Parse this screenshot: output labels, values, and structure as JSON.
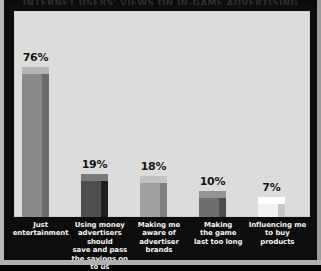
{
  "figure": {
    "title_strip": "INTERNET USERS' VIEWS ON IN-GAME ADVERTISING",
    "background_color": "#0d0d0d",
    "plot_background_color": "#dcdcdc"
  },
  "chart_data": {
    "type": "bar",
    "title": "INTERNET USERS' VIEWS ON IN-GAME ADVERTISING",
    "xlabel": "",
    "ylabel": "",
    "ylim": [
      0,
      100
    ],
    "grid": false,
    "legend": "none",
    "categories": [
      "Just entertainment",
      "Using money advertisers should save and pass the savings on to us",
      "Making me aware of advertiser brands",
      "Making the game last too long",
      "Influencing me to buy products"
    ],
    "values": [
      76,
      19,
      18,
      10,
      7
    ],
    "value_labels": [
      "76%",
      "19%",
      "18%",
      "10%",
      "7%"
    ],
    "bar_colors": [
      "#8a8a8a",
      "#4f4f4f",
      "#a0a0a0",
      "#6e6e6e",
      "#f2f2f2"
    ],
    "bar_side_colors": [
      "#6b6b6b",
      "#1f1f1f",
      "#7f7f7f",
      "#4c4c4c",
      "#c8c8c8"
    ],
    "bar_top_colors": [
      "#b4b4b4",
      "#7a7a7a",
      "#c2c2c2",
      "#949494",
      "#ffffff"
    ]
  },
  "bars": [
    {
      "label_lines": [
        "Just",
        "entertainment"
      ],
      "value_label": "76%",
      "value": 76,
      "front_color": "#8a8a8a",
      "side_color": "#6b6b6b",
      "top_color": "#b4b4b4"
    },
    {
      "label_lines": [
        "Using money",
        "advertisers should",
        "save and pass",
        "the savings on to us"
      ],
      "value_label": "19%",
      "value": 19,
      "front_color": "#4f4f4f",
      "side_color": "#1f1f1f",
      "top_color": "#7a7a7a"
    },
    {
      "label_lines": [
        "Making me",
        "aware of",
        "advertiser",
        "brands"
      ],
      "value_label": "18%",
      "value": 18,
      "front_color": "#a0a0a0",
      "side_color": "#7f7f7f",
      "top_color": "#c2c2c2"
    },
    {
      "label_lines": [
        "Making",
        "the game",
        "last too long"
      ],
      "value_label": "10%",
      "value": 10,
      "front_color": "#6e6e6e",
      "side_color": "#4c4c4c",
      "top_color": "#949494"
    },
    {
      "label_lines": [
        "Influencing me",
        "to buy",
        "products"
      ],
      "value_label": "7%",
      "value": 7,
      "front_color": "#f2f2f2",
      "side_color": "#c8c8c8",
      "top_color": "#ffffff"
    }
  ]
}
